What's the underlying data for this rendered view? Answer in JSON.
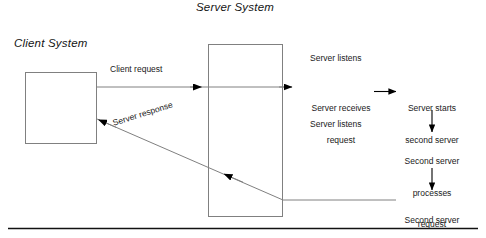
{
  "diagram": {
    "type": "client-server-sequence-diagram",
    "titles": {
      "client": "Client System",
      "server": "Server System"
    },
    "boxes": [
      {
        "name": "client-system-box",
        "label": ""
      },
      {
        "name": "server-system-box",
        "label": ""
      }
    ],
    "flows": {
      "client_request": "Client request",
      "server_response": "Server response"
    },
    "server_steps": {
      "listens_first": "Server listens",
      "receives_request_line1": "Server receives",
      "receives_request_line2": "request",
      "listens_second": "Server listens"
    },
    "second_server_steps": {
      "starts_line1": "Server starts",
      "starts_line2": "second server",
      "processes_line1": "Second server",
      "processes_line2": "processes",
      "processes_line3": "request",
      "responds_line1": "Second server",
      "responds_line2": "responds"
    },
    "colors": {
      "stroke": "#808080",
      "arrow_fill": "#000000",
      "text": "#1a1a1a",
      "baseline": "#111111",
      "background": "#ffffff"
    }
  }
}
